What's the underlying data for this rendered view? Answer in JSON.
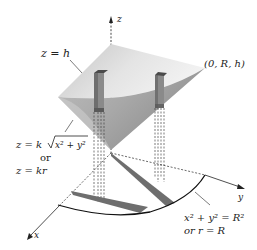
{
  "figure": {
    "axes": {
      "z_label": "z",
      "y_label": "y",
      "x_label": "x"
    },
    "labels": {
      "top_plane": "z = h",
      "corner_point": "(0, R, h)",
      "cone_eq_1_prefix": "z = k",
      "cone_eq_1_radicand": "x² + y²",
      "cone_or": "or",
      "cone_eq_2": "z = kr",
      "circle_eq": "x² + y² = R²",
      "circle_or": "or r = R"
    },
    "colors": {
      "plane_light": "#e6e6e6",
      "plane_dark": "#9a9a9a",
      "cone_light": "#d2d2d2",
      "cone_dark": "#8a8a8a",
      "column": "#7a7a7a",
      "column_top": "#4a4a4a",
      "strip": "#6e6e6e",
      "axis": "#222222"
    }
  }
}
